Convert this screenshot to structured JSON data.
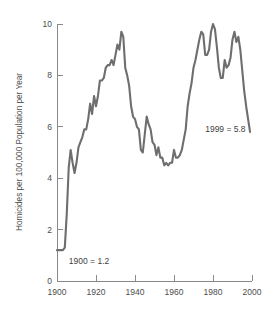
{
  "chart_data": {
    "type": "line",
    "title": "",
    "subtitle": "",
    "xlabel": "",
    "ylabel": "Homicides per 100,000 Population per Year",
    "xlim": [
      1900,
      2000
    ],
    "ylim": [
      0,
      10
    ],
    "grid": false,
    "legend": null,
    "legend_position": "none",
    "line_color": "#6e6e6e",
    "axis_color": "#8a8a8a",
    "xticks": [
      1900,
      1920,
      1940,
      1960,
      1980,
      2000
    ],
    "xtick_labels": [
      "1900",
      "1920",
      "1940",
      "1960",
      "1980",
      "2000"
    ],
    "yticks": [
      0,
      2,
      4,
      6,
      8,
      10
    ],
    "ytick_labels": [
      "0",
      "2",
      "4",
      "6",
      "8",
      "10"
    ],
    "annotations": [
      {
        "text": "1900 = 1.2",
        "x": 1903,
        "y": 1.2,
        "dx": 6,
        "dy": 14
      },
      {
        "text": "1999 = 5.8",
        "x": 1976,
        "y": 5.8,
        "dx": 0,
        "dy": 0
      }
    ],
    "series": [
      {
        "name": "Homicide rate",
        "x": [
          1900,
          1901,
          1902,
          1903,
          1904,
          1905,
          1906,
          1907,
          1908,
          1909,
          1910,
          1911,
          1912,
          1913,
          1914,
          1915,
          1916,
          1917,
          1918,
          1919,
          1920,
          1921,
          1922,
          1923,
          1924,
          1925,
          1926,
          1927,
          1928,
          1929,
          1930,
          1931,
          1932,
          1933,
          1934,
          1935,
          1936,
          1937,
          1938,
          1939,
          1940,
          1941,
          1942,
          1943,
          1944,
          1945,
          1946,
          1947,
          1948,
          1949,
          1950,
          1951,
          1952,
          1953,
          1954,
          1955,
          1956,
          1957,
          1958,
          1959,
          1960,
          1961,
          1962,
          1963,
          1964,
          1965,
          1966,
          1967,
          1968,
          1969,
          1970,
          1971,
          1972,
          1973,
          1974,
          1975,
          1976,
          1977,
          1978,
          1979,
          1980,
          1981,
          1982,
          1983,
          1984,
          1985,
          1986,
          1987,
          1988,
          1989,
          1990,
          1991,
          1992,
          1993,
          1994,
          1995,
          1996,
          1997,
          1998,
          1999
        ],
        "values": [
          1.2,
          1.2,
          1.2,
          1.2,
          1.3,
          2.6,
          4.4,
          5.1,
          4.6,
          4.2,
          4.6,
          5.2,
          5.4,
          5.6,
          5.9,
          5.9,
          6.3,
          6.9,
          6.5,
          7.2,
          6.8,
          7.2,
          7.8,
          7.8,
          7.9,
          8.3,
          8.4,
          8.4,
          8.6,
          8.4,
          8.8,
          9.2,
          9.0,
          9.7,
          9.5,
          8.3,
          8.0,
          7.6,
          6.8,
          6.4,
          6.3,
          6.0,
          5.9,
          5.1,
          5.0,
          5.7,
          6.4,
          6.1,
          5.9,
          5.4,
          5.3,
          4.9,
          5.2,
          4.8,
          4.8,
          4.5,
          4.6,
          4.5,
          4.6,
          4.6,
          5.1,
          4.8,
          4.8,
          4.9,
          5.1,
          5.5,
          5.9,
          6.8,
          7.3,
          7.7,
          8.3,
          8.6,
          9.0,
          9.4,
          9.7,
          9.6,
          8.8,
          8.8,
          9.0,
          9.7,
          10.0,
          9.8,
          9.1,
          8.3,
          7.9,
          7.9,
          8.6,
          8.3,
          8.4,
          8.7,
          9.4,
          9.7,
          9.3,
          9.5,
          9.0,
          8.2,
          7.4,
          6.8,
          6.3,
          5.8
        ]
      }
    ]
  },
  "plot_geometry": {
    "left": 57,
    "right": 252,
    "top": 24,
    "bottom": 281
  }
}
